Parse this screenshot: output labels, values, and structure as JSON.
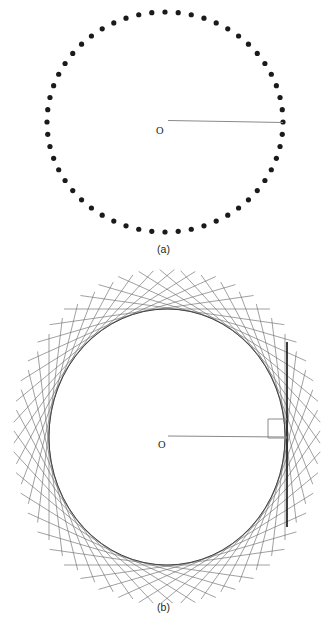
{
  "figure": {
    "panels": [
      {
        "id": "panel-a",
        "caption": "(a)",
        "center_label": "O",
        "kind": "dotted-circle-with-radius",
        "geometry": {
          "cx": 165,
          "cy": 122,
          "rx": 118,
          "ry": 110,
          "dot_count": 56,
          "dot_radius": 2.6,
          "dot_color": "#1a1a1a",
          "radius_line": {
            "x1": 168,
            "y1": 120.5,
            "x2": 283,
            "y2": 122.5
          },
          "radius_line_color": "#8a8a8a",
          "radius_line_width": 1.1,
          "label_pos": {
            "x": 156,
            "y": 134
          }
        }
      },
      {
        "id": "panel-b",
        "caption": "(b)",
        "center_label": "O",
        "kind": "tangent-envelope-circle-with-radius-and-right-angle",
        "geometry": {
          "cx": 167,
          "cy": 169,
          "rx": 118,
          "ry": 128,
          "tangent_count": 48,
          "tangent_half_length": 103,
          "tangent_color": "#6e6e6e",
          "tangent_width": 0.65,
          "circle_outline_color": "#3a3a3a",
          "circle_outline_width": 0.9,
          "vertical_tangent": {
            "x": 287,
            "y1": 74,
            "y2": 259
          },
          "vertical_tangent_color": "#1a1a1a",
          "vertical_tangent_width": 1.7,
          "radius_line": {
            "x1": 168,
            "y1": 168,
            "x2": 287,
            "y2": 169
          },
          "radius_line_color": "#8a8a8a",
          "radius_line_width": 1.1,
          "right_angle_square": {
            "x": 268,
            "y": 151,
            "size": 19
          },
          "right_angle_color": "#8a8a8a",
          "label_pos": {
            "x": 158,
            "y": 180
          }
        }
      }
    ]
  },
  "chart_data": {
    "type": "diagram",
    "title": "",
    "description_panels": [
      "(a)",
      "(b)"
    ]
  }
}
